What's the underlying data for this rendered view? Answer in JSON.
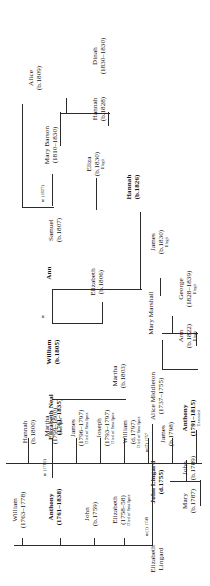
{
  "generations": {
    "g1": {
      "wife": {
        "name": "Elizabeth",
        "surname": "Lingard"
      },
      "husband": {
        "name": "John Lingard",
        "dates": "(d.1755)"
      },
      "second_wife": {
        "name": "Alice Middleton",
        "dates": "(1737–1755)"
      },
      "marriage1": "m(1) 1749",
      "marriage2": "m(2) 1757"
    },
    "g2": [
      {
        "name": "Elizabeth",
        "dates": "(1758–58)",
        "note": "Died of Smallpox"
      },
      {
        "name": "John",
        "dates": "(b.1759)",
        "note": ""
      },
      {
        "name": "Anthony",
        "dates": "(1761–1838)",
        "note": "",
        "bold": true
      },
      {
        "name": "William",
        "dates": "(1763–1778)",
        "note": ""
      }
    ],
    "g2_spouse": {
      "name": "Elizabeth Neal",
      "dates": "(1761–1835)",
      "bold": true
    },
    "g2_marriage": "m (1786)",
    "g3": [
      {
        "name": "James",
        "dates": "(b.1798)",
        "note": ""
      },
      {
        "name": "William",
        "dates": "(d.1797)",
        "note": "Died of Smallpox"
      },
      {
        "name": "Joseph",
        "dates": "(1793–1797)",
        "note": "Died of Smallpox"
      },
      {
        "name": "James",
        "dates": "(1796–1797)",
        "note": "Died of Smallpox"
      },
      {
        "name": "Martha",
        "dates": "(1799–1800)",
        "note": "Smallpox"
      },
      {
        "name": "Hannah",
        "dates": "(b.1800)",
        "note": ""
      },
      {
        "name": "Martha",
        "dates": "(b.1803)",
        "note": ""
      },
      {
        "name": "William",
        "dates": "(b.1805)",
        "note": "",
        "bold": true
      },
      {
        "name": "Elizabeth",
        "dates": "(b.1806)",
        "note": ""
      },
      {
        "name": "Samuel",
        "dates": "(b.1807)",
        "note": ""
      }
    ],
    "g3_spouses": [
      {
        "name": "Mary Marshall",
        "dates": ""
      },
      {
        "name": "Ann",
        "dates": "",
        "bold": true
      },
      {
        "name": "Mary Barson",
        "dates": "(1810–1830)"
      }
    ],
    "g3_marriages": [
      {
        "label": "m"
      },
      {
        "label": "m (1827)"
      }
    ],
    "g4": [
      {
        "name": "Mary",
        "dates": "(b.1787)",
        "note": ""
      },
      {
        "name": "John",
        "dates": "(b.1789)",
        "note": ""
      },
      {
        "name": "Anthony",
        "dates": "(1791–1815)",
        "note": "Executed",
        "bold": true
      },
      {
        "name": "Ann",
        "dates": "(b.1822)",
        "note": "Illegit"
      },
      {
        "name": "George",
        "dates": "(1828–1839)",
        "note": "Illegit"
      },
      {
        "name": "James",
        "dates": "(b.1830)",
        "note": "Illegit"
      },
      {
        "name": "Eliza",
        "dates": "(b.1830)",
        "note": "Illegit"
      },
      {
        "name": "Hannah",
        "dates": "(b.1826)",
        "note": "",
        "bold": true
      },
      {
        "name": "Hannah",
        "dates": "(b.1828)",
        "note": ""
      },
      {
        "name": "Dinah",
        "dates": "(1830–1830)",
        "note": ""
      },
      {
        "name": "Alice",
        "dates": "(b.1809)",
        "note": ""
      }
    ]
  },
  "colors": {
    "line": "#2b2b2b",
    "text": "#111111",
    "background": "#ffffff"
  }
}
